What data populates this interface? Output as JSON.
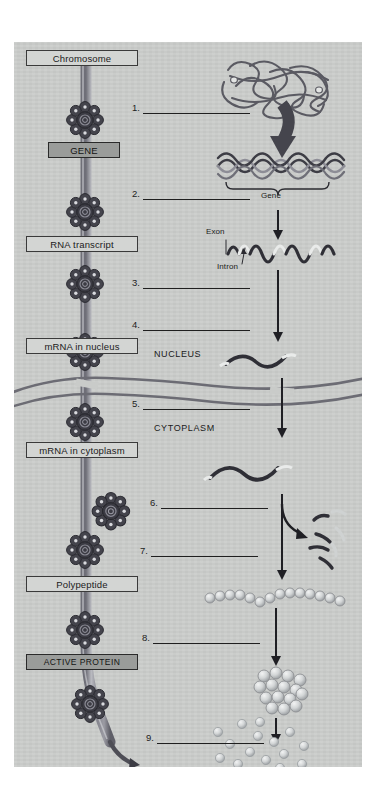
{
  "page": {
    "background_color": "#ffffff",
    "panel_color": "#c9cbc9"
  },
  "stage_labels": [
    {
      "id": "chromosome",
      "text": "Chromosome",
      "style": "light"
    },
    {
      "id": "gene",
      "text": "GENE",
      "style": "dark"
    },
    {
      "id": "rna-transcript",
      "text": "RNA transcript",
      "style": "light"
    },
    {
      "id": "mrna-nucleus",
      "text": "mRNA in nucleus",
      "style": "light"
    },
    {
      "id": "mrna-cytoplasm",
      "text": "mRNA in cytoplasm",
      "style": "light"
    },
    {
      "id": "polypeptide",
      "text": "Polypeptide",
      "style": "light"
    },
    {
      "id": "active-protein",
      "text": "ACTIVE PROTEIN",
      "style": "dark"
    }
  ],
  "compartments": [
    {
      "id": "nucleus",
      "text": "NUCLEUS"
    },
    {
      "id": "cytoplasm",
      "text": "CYTOPLASM"
    }
  ],
  "answer_lines": [
    {
      "number": "1.",
      "answer": ""
    },
    {
      "number": "2.",
      "answer": ""
    },
    {
      "number": "3.",
      "answer": ""
    },
    {
      "number": "4.",
      "answer": ""
    },
    {
      "number": "5.",
      "answer": ""
    },
    {
      "number": "6.",
      "answer": ""
    },
    {
      "number": "7.",
      "answer": ""
    },
    {
      "number": "8.",
      "answer": ""
    },
    {
      "number": "9.",
      "answer": ""
    }
  ],
  "annotations": [
    {
      "id": "gene-bracket",
      "text": "Gene"
    },
    {
      "id": "exon",
      "text": "Exon"
    },
    {
      "id": "intron",
      "text": "Intron"
    }
  ],
  "colors": {
    "panel": "#c9cbc9",
    "box_light": "#d3d5d3",
    "box_dark": "#9a9c9a",
    "ink": "#1f1f1f",
    "strand": "#8e8e96",
    "ribosome": "#4a4a52",
    "bead": "#cfd2d4"
  }
}
